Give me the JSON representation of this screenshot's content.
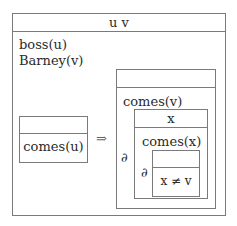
{
  "outer": {
    "referents": "u v",
    "conditions": [
      "boss(u)",
      "Barney(v)"
    ]
  },
  "antecedent": {
    "referents": "",
    "conditions": [
      "comes(u)"
    ]
  },
  "implication_symbol": "⇒",
  "consequent": {
    "referents": "",
    "conditions": [
      "comes(v)"
    ],
    "nested": {
      "operator": "∂",
      "referents": "x",
      "conditions": [
        "comes(x)"
      ],
      "nested": {
        "operator": "∂",
        "referents": "",
        "conditions": [
          "x ≠ v"
        ]
      }
    }
  }
}
